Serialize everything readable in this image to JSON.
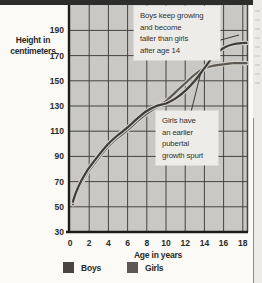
{
  "figure": {
    "axis_title": "Height in\ncentimeters",
    "x_axis_title": "Age in years"
  },
  "annotations": {
    "boys_note": "Boys keep growing\nand become\ntaller than girls\nafter age 14",
    "girls_note": "Girls have\nan earlier\npubertal\ngrowth spurt"
  },
  "legend": {
    "items": [
      {
        "label": "Boys",
        "color": "#474441"
      },
      {
        "label": "Girls",
        "color": "#5c5954"
      }
    ]
  },
  "colors": {
    "plot_background": "#c9c8c4",
    "gridline": "#45443f",
    "axis_line": "#1c1c1a",
    "curve_halo": "#d4d2cc",
    "leader_line": "#3a3a38"
  },
  "chart_data": {
    "type": "line",
    "title": "",
    "xlabel": "Age in years",
    "ylabel": "Height in centimeters",
    "xlim": [
      0,
      18.5
    ],
    "ylim": [
      30,
      210
    ],
    "xticks": [
      0,
      2,
      4,
      6,
      8,
      10,
      12,
      14,
      16,
      18
    ],
    "yticks": [
      190,
      170,
      150,
      130,
      110,
      90,
      70,
      50,
      30
    ],
    "grid": true,
    "legend_position": "bottom",
    "series": [
      {
        "name": "Boys",
        "color": "#403c3a",
        "x": [
          0.3,
          0.6,
          1,
          1.5,
          2,
          3,
          4,
          5,
          6,
          7,
          8,
          9,
          10,
          11,
          12,
          13,
          14,
          15,
          16,
          17,
          18,
          18.4
        ],
        "y": [
          54,
          61,
          68,
          75,
          81,
          91,
          100,
          107,
          113,
          120,
          126,
          130,
          132,
          136,
          142,
          150,
          160,
          170,
          176,
          179,
          180,
          180
        ]
      },
      {
        "name": "Girls",
        "color": "#5d5952",
        "x": [
          0.3,
          0.6,
          1,
          1.5,
          2,
          3,
          4,
          5,
          6,
          7,
          8,
          9,
          10,
          11,
          12,
          13,
          14,
          15,
          16,
          17,
          18,
          18.4
        ],
        "y": [
          52,
          59,
          66,
          73,
          79,
          89,
          98,
          105,
          111,
          118,
          124,
          129,
          134,
          141,
          148,
          155,
          160,
          162,
          163,
          164,
          164,
          164
        ]
      }
    ],
    "annotations": [
      "Boys keep growing and become taller than girls after age 14",
      "Girls have an earlier pubertal growth spurt"
    ]
  }
}
